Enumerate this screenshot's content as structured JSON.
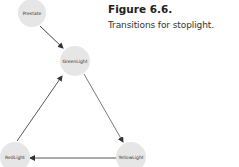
{
  "figure": {
    "title": "Figure 6.6.",
    "caption": "Transitions for stoplight."
  },
  "diagram": {
    "type": "state-transition",
    "nodes": [
      {
        "id": "prestate",
        "label": "Prestate"
      },
      {
        "id": "green",
        "label": "GreenLight"
      },
      {
        "id": "yellow",
        "label": "YellowLight"
      },
      {
        "id": "red",
        "label": "RedLight"
      }
    ],
    "edges": [
      {
        "from": "Prestate",
        "to": "GreenLight"
      },
      {
        "from": "GreenLight",
        "to": "YellowLight"
      },
      {
        "from": "YellowLight",
        "to": "RedLight"
      },
      {
        "from": "RedLight",
        "to": "GreenLight"
      }
    ],
    "colors": {
      "node_fill": "#e6e6e6",
      "edge": "#333333"
    }
  }
}
